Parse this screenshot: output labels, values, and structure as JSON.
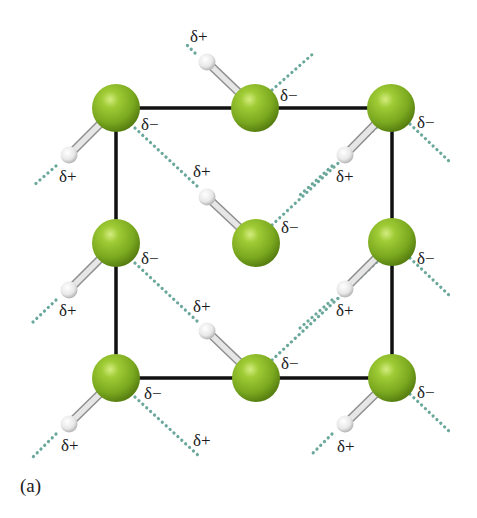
{
  "figure": {
    "caption": "(a)",
    "colors": {
      "chlorine": "#8cb82a",
      "chlorine_highlight": "#c8e070",
      "chlorine_shadow": "#5e8a14",
      "hydrogen": "#f2f2f2",
      "bond": "#cccccc",
      "unit_cell_edge": "#111111",
      "dipole_interaction_dots": "#6aa89c"
    },
    "unit_cell": {
      "x1": 116,
      "y1": 108,
      "x2": 392,
      "y2": 378
    },
    "molecules": [
      {
        "id": "tl",
        "cl": [
          116,
          108
        ],
        "h": [
          69,
          155
        ],
        "cl_label": "δ−",
        "h_label": "δ+"
      },
      {
        "id": "tm",
        "cl": [
          255,
          108
        ],
        "h": [
          207,
          62
        ],
        "cl_label": "δ−",
        "h_label": "δ+"
      },
      {
        "id": "tr",
        "cl": [
          391,
          108
        ],
        "h": [
          345,
          155
        ],
        "cl_label": "δ−",
        "h_label": "δ+"
      },
      {
        "id": "ml",
        "cl": [
          116,
          243
        ],
        "h": [
          69,
          290
        ],
        "cl_label": "δ−",
        "h_label": "δ+"
      },
      {
        "id": "c",
        "cl": [
          256,
          243
        ],
        "h": [
          207,
          197
        ],
        "cl_label": "δ−",
        "h_label": "δ+"
      },
      {
        "id": "mr",
        "cl": [
          392,
          242
        ],
        "h": [
          345,
          289
        ],
        "cl_label": "δ−",
        "h_label": "δ+"
      },
      {
        "id": "bl",
        "cl": [
          116,
          378
        ],
        "h": [
          69,
          424
        ],
        "cl_label": "δ−",
        "h_label": "δ+"
      },
      {
        "id": "bm",
        "cl": [
          256,
          378
        ],
        "h": [
          207,
          331
        ],
        "cl_label": "δ−",
        "h_label": "δ+"
      },
      {
        "id": "br",
        "cl": [
          392,
          378
        ],
        "h": [
          345,
          424
        ],
        "cl_label": "δ−",
        "h_label": "δ+"
      }
    ],
    "labels": [
      {
        "text": "δ+",
        "x": 190,
        "y": 28
      },
      {
        "text": "δ−",
        "x": 280,
        "y": 87
      },
      {
        "text": "δ−",
        "x": 141,
        "y": 116
      },
      {
        "text": "δ−",
        "x": 417,
        "y": 114
      },
      {
        "text": "δ+",
        "x": 59,
        "y": 168
      },
      {
        "text": "δ+",
        "x": 193,
        "y": 163
      },
      {
        "text": "δ+",
        "x": 336,
        "y": 168
      },
      {
        "text": "δ−",
        "x": 281,
        "y": 219
      },
      {
        "text": "δ−",
        "x": 141,
        "y": 250
      },
      {
        "text": "δ−",
        "x": 417,
        "y": 250
      },
      {
        "text": "δ+",
        "x": 59,
        "y": 302
      },
      {
        "text": "δ+",
        "x": 193,
        "y": 298
      },
      {
        "text": "δ+",
        "x": 336,
        "y": 302
      },
      {
        "text": "δ−",
        "x": 281,
        "y": 355
      },
      {
        "text": "δ−",
        "x": 144,
        "y": 385
      },
      {
        "text": "δ−",
        "x": 417,
        "y": 384
      },
      {
        "text": "δ+",
        "x": 61,
        "y": 437
      },
      {
        "text": "δ+",
        "x": 193,
        "y": 432
      },
      {
        "text": "δ+",
        "x": 337,
        "y": 438
      }
    ],
    "dotted_interactions": [
      {
        "from": [
          56,
          166
        ],
        "to": [
          33,
          186
        ]
      },
      {
        "from": [
          195,
          53
        ],
        "to": [
          187,
          45
        ]
      },
      {
        "from": [
          332,
          166
        ],
        "to": [
          300,
          195
        ]
      },
      {
        "from": [
          272,
          90
        ],
        "to": [
          315,
          52
        ]
      },
      {
        "from": [
          135,
          128
        ],
        "to": [
          197,
          186
        ]
      },
      {
        "from": [
          410,
          124
        ],
        "to": [
          450,
          162
        ]
      },
      {
        "from": [
          56,
          300
        ],
        "to": [
          33,
          322
        ]
      },
      {
        "from": [
          272,
          225
        ],
        "to": [
          395,
          110
        ]
      },
      {
        "from": [
          332,
          300
        ],
        "to": [
          300,
          328
        ]
      },
      {
        "from": [
          135,
          263
        ],
        "to": [
          197,
          321
        ]
      },
      {
        "from": [
          410,
          258
        ],
        "to": [
          450,
          296
        ]
      },
      {
        "from": [
          272,
          360
        ],
        "to": [
          395,
          245
        ]
      },
      {
        "from": [
          56,
          434
        ],
        "to": [
          33,
          457
        ]
      },
      {
        "from": [
          135,
          397
        ],
        "to": [
          200,
          457
        ]
      },
      {
        "from": [
          332,
          434
        ],
        "to": [
          310,
          456
        ]
      },
      {
        "from": [
          410,
          394
        ],
        "to": [
          450,
          432
        ]
      }
    ]
  }
}
